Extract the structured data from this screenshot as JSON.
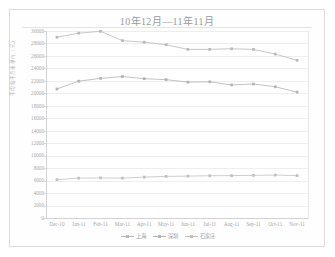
{
  "figure": {
    "background": "#ffffff",
    "frame_color": "#dcdcdc"
  },
  "chart_data": {
    "type": "line",
    "title": "10年12月—11年11月",
    "xlabel": "",
    "ylabel": "平均每平方米单价（元）",
    "ylim": [
      0,
      30000
    ],
    "ytick_step": 2000,
    "yticks": [
      "0",
      "2000",
      "4000",
      "6000",
      "8000",
      "10000",
      "12000",
      "14000",
      "16000",
      "18000",
      "20000",
      "22000",
      "24000",
      "26000",
      "28000",
      "30000"
    ],
    "grid": true,
    "legend_position": "bottom-center",
    "categories": [
      "Dec-10",
      "Jan-11",
      "Feb-11",
      "Mar-11",
      "Apr-11",
      "May-11",
      "Jun-11",
      "Jul-11",
      "Aug-11",
      "Sep-11",
      "Oct-11",
      "Nov-11"
    ],
    "series": [
      {
        "name": "上海",
        "color": "#b9b9b9",
        "marker": "square",
        "values": [
          29000,
          29650,
          29950,
          28450,
          28200,
          27800,
          27050,
          27050,
          27150,
          27050,
          26300,
          25300
        ]
      },
      {
        "name": "深圳",
        "color": "#b3b3b3",
        "marker": "square",
        "values": [
          20700,
          21950,
          22400,
          22700,
          22350,
          22200,
          21800,
          21850,
          21350,
          21500,
          21050,
          20200
        ]
      },
      {
        "name": "石家庄",
        "color": "#c0c0c0",
        "marker": "square",
        "values": [
          6150,
          6400,
          6430,
          6400,
          6560,
          6680,
          6720,
          6780,
          6800,
          6840,
          6890,
          6800
        ]
      }
    ]
  }
}
